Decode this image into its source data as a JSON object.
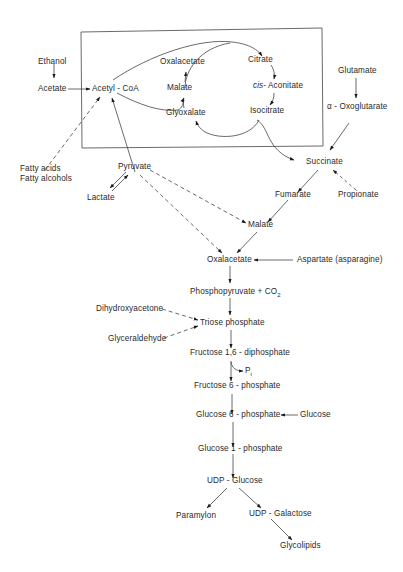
{
  "diagram": {
    "type": "metabolic-pathway",
    "cycle_box_label": "glyoxylate cycle",
    "nodes": {
      "ethanol": "Ethanol",
      "acetate": "Acetate",
      "acetyl_coa": "Acetyl - CoA",
      "oxalacetate_cycle": "Oxalacetate",
      "malate_cycle": "Malate",
      "glyoxalate": "Glyoxalate",
      "citrate": "Citrate",
      "cis_prefix": "cis",
      "cis_aconitate": "- Aconitate",
      "isocitrate": "Isocitrate",
      "glutamate": "Glutamate",
      "oxoglutarate": "α - Oxoglutarate",
      "fatty_acids": "Fatty acids",
      "fatty_alcohols": "Fatty alcohols",
      "pyruvate": "Pyruvate",
      "lactate": "Lactate",
      "succinate": "Succinate",
      "fumarate": "Fumarate",
      "propionate": "Propionate",
      "malate": "Malate",
      "oxalacetate": "Oxalacetate",
      "aspartate": "Aspartate  (asparagine)",
      "phosphopyruvate": "Phosphopyruvate + CO",
      "co2_sub": "2",
      "dihydroxyacetone": "Dihydroxyacetone",
      "glyceraldehyde": "Glyceraldehyde",
      "triose_phosphate": "Triose  phosphate",
      "fructose_16_diphosphate": "Fructose  1,6 - diphosphate",
      "pi": "P",
      "pi_sub": "i",
      "fructose_6_phosphate": "Fructose  6 - phosphate",
      "glucose_6_phosphate": "Glucose  6 - phosphate",
      "glucose": "Glucose",
      "glucose_1_phosphate": "Glucose  1 - phosphate",
      "udp_glucose": "UDP - Glucose",
      "paramylon": "Paramylon",
      "udp_galactose": "UDP - Galactose",
      "glycolipids": "Glycolipids"
    },
    "edges": [
      {
        "from": "Ethanol",
        "to": "Acetate",
        "style": "solid"
      },
      {
        "from": "Acetate",
        "to": "Acetyl-CoA",
        "style": "solid"
      },
      {
        "from": "Acetyl-CoA",
        "to": "Citrate",
        "style": "solid"
      },
      {
        "from": "Oxalacetate",
        "to": "Citrate",
        "style": "solid"
      },
      {
        "from": "Citrate",
        "to": "cis-Aconitate",
        "style": "solid"
      },
      {
        "from": "cis-Aconitate",
        "to": "Isocitrate",
        "style": "solid"
      },
      {
        "from": "Isocitrate",
        "to": "Glyoxalate",
        "style": "solid"
      },
      {
        "from": "Isocitrate",
        "to": "Succinate",
        "style": "solid"
      },
      {
        "from": "Acetyl-CoA",
        "to": "Malate",
        "style": "solid"
      },
      {
        "from": "Glyoxalate",
        "to": "Malate",
        "style": "solid"
      },
      {
        "from": "Malate",
        "to": "Oxalacetate",
        "style": "solid"
      },
      {
        "from": "Fatty acids/alcohols",
        "to": "Acetyl-CoA",
        "style": "dashed"
      },
      {
        "from": "Pyruvate",
        "to": "Acetyl-CoA",
        "style": "solid"
      },
      {
        "from": "Pyruvate",
        "to": "Lactate",
        "style": "reversible"
      },
      {
        "from": "Pyruvate",
        "to": "Malate",
        "style": "dashed"
      },
      {
        "from": "Pyruvate",
        "to": "Oxalacetate",
        "style": "dashed"
      },
      {
        "from": "Glutamate",
        "to": "α-Oxoglutarate",
        "style": "solid"
      },
      {
        "from": "α-Oxoglutarate",
        "to": "Succinate",
        "style": "solid"
      },
      {
        "from": "Propionate",
        "to": "Succinate",
        "style": "dashed"
      },
      {
        "from": "Succinate",
        "to": "Fumarate",
        "style": "solid"
      },
      {
        "from": "Fumarate",
        "to": "Malate",
        "style": "solid"
      },
      {
        "from": "Malate",
        "to": "Oxalacetate",
        "style": "solid"
      },
      {
        "from": "Aspartate",
        "to": "Oxalacetate",
        "style": "solid"
      },
      {
        "from": "Oxalacetate",
        "to": "Phosphopyruvate",
        "style": "solid"
      },
      {
        "from": "Phosphopyruvate",
        "to": "Triose phosphate",
        "style": "solid"
      },
      {
        "from": "Dihydroxyacetone",
        "to": "Triose phosphate",
        "style": "dashed"
      },
      {
        "from": "Glyceraldehyde",
        "to": "Triose phosphate",
        "style": "dashed"
      },
      {
        "from": "Triose phosphate",
        "to": "Fructose 1,6-diphosphate",
        "style": "solid"
      },
      {
        "from": "Fructose 1,6-diphosphate",
        "to": "Fructose 6-phosphate",
        "style": "solid",
        "releases": "Pi"
      },
      {
        "from": "Fructose 6-phosphate",
        "to": "Glucose 6-phosphate",
        "style": "solid"
      },
      {
        "from": "Glucose",
        "to": "Glucose 6-phosphate",
        "style": "solid"
      },
      {
        "from": "Glucose 6-phosphate",
        "to": "Glucose 1-phosphate",
        "style": "solid"
      },
      {
        "from": "Glucose 1-phosphate",
        "to": "UDP-Glucose",
        "style": "solid"
      },
      {
        "from": "UDP-Glucose",
        "to": "Paramylon",
        "style": "solid"
      },
      {
        "from": "UDP-Glucose",
        "to": "UDP-Galactose",
        "style": "solid"
      },
      {
        "from": "UDP-Galactose",
        "to": "Glycolipids",
        "style": "solid"
      }
    ],
    "colors": {
      "ink": "#2a2a2a",
      "background": "#ffffff"
    }
  }
}
